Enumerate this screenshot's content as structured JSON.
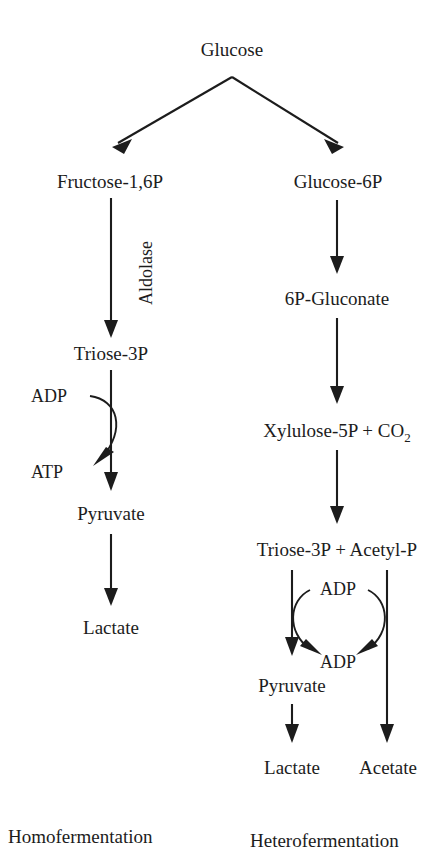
{
  "diagram": {
    "ink_color": "#1c1c1c",
    "background_color": "#ffffff",
    "nodes": {
      "glucose": "Glucose",
      "fructose_16p": "Fructose-1,6P",
      "glucose_6p": "Glucose-6P",
      "triose_3p_left": "Triose-3P",
      "gluconate_6p": "6P-Gluconate",
      "xylulose_5p": "Xylulose-5P + CO",
      "xylulose_5p_subscript": "2",
      "triose_acetyl": "Triose-3P  +  Acetyl-P",
      "pyruvate_left": "Pyruvate",
      "pyruvate_right": "Pyruvate",
      "lactate_left": "Lactate",
      "lactate_right": "Lactate",
      "acetate_right": "Acetate"
    },
    "cofactors": {
      "adp_left": "ADP",
      "atp_left": "ATP",
      "adp_right_top": "ADP",
      "adp_right_bottom": "ADP"
    },
    "enzymes": {
      "aldolase": "Aldolase"
    },
    "pathway_labels": {
      "left": "Homofermentation",
      "right": "Heterofermentation"
    }
  }
}
